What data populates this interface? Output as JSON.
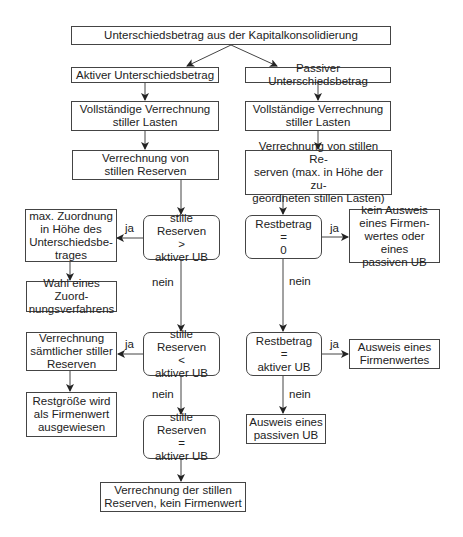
{
  "diagram": {
    "title_box": "Unterschiedsbetrag aus der Kapitalkonsolidierung",
    "left": {
      "header": "Aktiver Unterschiedsbetrag",
      "step1": "Vollständige Verrechnung\nstiller Lasten",
      "step2": "Verrechnung von\nstillen Reserven",
      "decision1": "stille Reserven\n>\naktiver UB",
      "decision1_yes": "max. Zuordnung\nin Höhe des\nUnterschiedsbe-\ntrages",
      "decision1_yes_next": "Wahl eines Zuord-\nnungsverfahrens",
      "decision2": "stille Reserven\n<\naktiver UB",
      "decision2_yes": "Verrechnung\nsämtlicher stiller\nReserven",
      "decision2_yes_next": "Restgröße wird\nals Firmenwert\nausgewiesen",
      "decision3": "stille Reserven\n=\naktiver UB",
      "final": "Verrechnung der stillen\nReserven, kein Firmenwert"
    },
    "right": {
      "header": "Passiver Unterschiedsbetrag",
      "step1": "Vollständige Verrechnung\nstiller Lasten",
      "step2": "Verrechnung von stillen Re-\nserven (max. in Höhe der zu-\ngeordneten stillen Lasten)",
      "decision1": "Restbetrag\n=\n0",
      "decision1_yes": "kein Ausweis\neines Firmen-\nwertes oder eines\npassiven UB",
      "decision2": "Restbetrag\n=\naktiver UB",
      "decision2_yes": "Ausweis eines\nFirmenwertes",
      "decision2_no": "Ausweis eines\npassiven UB"
    },
    "labels": {
      "yes": "ja",
      "no": "nein"
    }
  }
}
